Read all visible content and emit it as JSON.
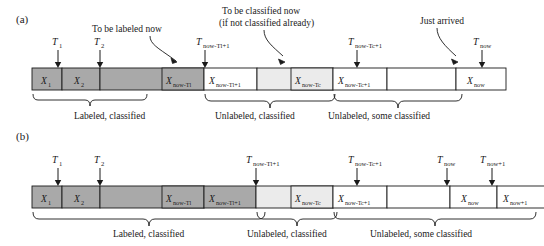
{
  "figure": {
    "panels": [
      {
        "id": "a",
        "label": "(a)",
        "annotations": [
          {
            "name": "to-be-labeled-now",
            "lines": [
              "To be labeled now"
            ]
          },
          {
            "name": "to-be-classified-now",
            "lines": [
              "To be classified now",
              "(if not classified already)"
            ]
          },
          {
            "name": "just-arrived",
            "lines": [
              "Just arrived"
            ]
          }
        ],
        "ticks": [
          {
            "name": "t1",
            "base": "T",
            "sub": "1"
          },
          {
            "name": "t2",
            "base": "T",
            "sub": "2"
          },
          {
            "name": "t-now-tl-1",
            "base": "T",
            "sub": "now-Tl+1"
          },
          {
            "name": "t-now-tc-1",
            "base": "T",
            "sub": "now-Tc+1"
          },
          {
            "name": "t-now",
            "base": "T",
            "sub": "now"
          }
        ],
        "cells": [
          {
            "name": "x1",
            "base": "X",
            "sub": "1",
            "shade": "dark"
          },
          {
            "name": "x2",
            "base": "X",
            "sub": "2",
            "shade": "dark"
          },
          {
            "name": "gap-dark",
            "base": "",
            "sub": "",
            "shade": "dark"
          },
          {
            "name": "x-now-tl",
            "base": "X",
            "sub": "now-Tl",
            "shade": "dark"
          },
          {
            "name": "x-now-tl-1",
            "base": "X",
            "sub": "now-Tl+1",
            "shade": "light"
          },
          {
            "name": "gap-light",
            "base": "",
            "sub": "",
            "shade": "light"
          },
          {
            "name": "x-now-tc",
            "base": "X",
            "sub": "now-Tc",
            "shade": "light"
          },
          {
            "name": "x-now-tc-1",
            "base": "X",
            "sub": "now-Tc+1",
            "shade": "white"
          },
          {
            "name": "gap-white",
            "base": "",
            "sub": "",
            "shade": "white"
          },
          {
            "name": "x-now",
            "base": "X",
            "sub": "now",
            "shade": "white"
          }
        ],
        "braces": [
          {
            "name": "brace-labeled-classified",
            "label": "Labeled, classified"
          },
          {
            "name": "brace-unlabeled-classified",
            "label": "Unlabeled, classified"
          },
          {
            "name": "brace-unlabeled-some-classified",
            "label": "Unlabeled, some classified"
          }
        ]
      },
      {
        "id": "b",
        "label": "(b)",
        "annotations": [],
        "ticks": [
          {
            "name": "t1",
            "base": "T",
            "sub": "1"
          },
          {
            "name": "t2",
            "base": "T",
            "sub": "2"
          },
          {
            "name": "t-now-tl-1",
            "base": "T",
            "sub": "now-Tl+1"
          },
          {
            "name": "t-now-tc-1",
            "base": "T",
            "sub": "now-Tc+1"
          },
          {
            "name": "t-now",
            "base": "T",
            "sub": "now"
          },
          {
            "name": "t-now-1",
            "base": "T",
            "sub": "now+1"
          }
        ],
        "cells": [
          {
            "name": "x1",
            "base": "X",
            "sub": "1",
            "shade": "dark"
          },
          {
            "name": "x2",
            "base": "X",
            "sub": "2",
            "shade": "dark"
          },
          {
            "name": "gap-dark",
            "base": "",
            "sub": "",
            "shade": "dark"
          },
          {
            "name": "x-now-tl",
            "base": "X",
            "sub": "now-Tl",
            "shade": "dark"
          },
          {
            "name": "x-now-tl-1",
            "base": "X",
            "sub": "now-Tl+1",
            "shade": "dark"
          },
          {
            "name": "gap-light",
            "base": "",
            "sub": "",
            "shade": "light"
          },
          {
            "name": "x-now-tc",
            "base": "X",
            "sub": "now-Tc",
            "shade": "light"
          },
          {
            "name": "x-now-tc-1",
            "base": "X",
            "sub": "now-Tc+1",
            "shade": "white"
          },
          {
            "name": "gap-white",
            "base": "",
            "sub": "",
            "shade": "white"
          },
          {
            "name": "x-now",
            "base": "X",
            "sub": "now",
            "shade": "white"
          },
          {
            "name": "x-now-1",
            "base": "X",
            "sub": "now+1",
            "shade": "white"
          }
        ],
        "braces": [
          {
            "name": "brace-labeled-classified",
            "label": "Labeled, classified"
          },
          {
            "name": "brace-unlabeled-classified",
            "label": "Unlabeled, classified"
          },
          {
            "name": "brace-unlabeled-some-classified",
            "label": "Unlabeled, some classified"
          }
        ]
      }
    ],
    "colors": {
      "dark_fill": "#a9a9a9",
      "light_fill": "#ebebeb",
      "white_fill": "#ffffff",
      "stroke": "#1a1a1a",
      "background": "#ffffff"
    }
  }
}
